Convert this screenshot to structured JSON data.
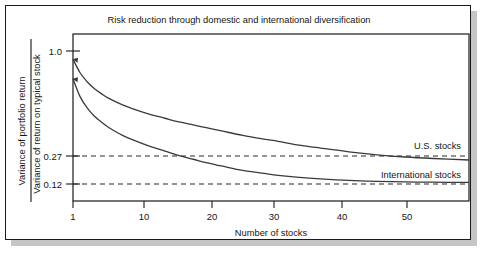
{
  "figure": {
    "title": "Risk reduction through domestic and international diversification"
  },
  "axes": {
    "x_title": "Number of stocks",
    "y_title_numerator": "Variance of portfolio return",
    "y_title_denominator": "Variance of return on typical stock",
    "x_ticks": [
      "1",
      "10",
      "20",
      "30",
      "40",
      "50"
    ],
    "y_ticks": [
      "1.0",
      "0.27",
      "0.12"
    ]
  },
  "series_labels": {
    "us": "U.S. stocks",
    "international": "International stocks"
  },
  "colors": {
    "curve": "#3a3a3a",
    "frame": "#1a1a1a",
    "text": "#151515",
    "background": "#ffffff",
    "shadow": "#969696"
  },
  "chart_data": {
    "type": "line",
    "title": "Risk reduction through domestic and international diversification",
    "xlabel": "Number of stocks",
    "ylabel": "Variance of portfolio return / Variance of return on typical stock",
    "xlim": [
      1,
      57
    ],
    "ylim": [
      0.0,
      1.12
    ],
    "grid": false,
    "legend": "inline-right",
    "x_ticks": [
      1,
      10,
      20,
      30,
      40,
      50
    ],
    "y_ticks": [
      1.0,
      0.27,
      0.12
    ],
    "annotations": [
      {
        "text": "U.S. stocks",
        "x": 47,
        "y": 0.42
      },
      {
        "text": "International stocks",
        "x": 45,
        "y": 0.22
      }
    ],
    "reference_lines": [
      {
        "label": "0.27",
        "value": 0.27,
        "style": "dashed"
      },
      {
        "label": "0.12",
        "value": 0.12,
        "style": "dashed"
      }
    ],
    "x": [
      1,
      2,
      3,
      4,
      5,
      6,
      8,
      10,
      12,
      14,
      16,
      18,
      20,
      22,
      25,
      28,
      30,
      33,
      36,
      40,
      44,
      48,
      52,
      57
    ],
    "series": [
      {
        "name": "U.S. stocks",
        "values": [
          0.95,
          0.86,
          0.8,
          0.755,
          0.72,
          0.69,
          0.645,
          0.61,
          0.58,
          0.555,
          0.53,
          0.51,
          0.49,
          0.47,
          0.44,
          0.415,
          0.4,
          0.375,
          0.355,
          0.33,
          0.31,
          0.295,
          0.285,
          0.275
        ]
      },
      {
        "name": "International stocks",
        "values": [
          0.82,
          0.7,
          0.625,
          0.57,
          0.53,
          0.495,
          0.44,
          0.4,
          0.365,
          0.335,
          0.305,
          0.28,
          0.255,
          0.235,
          0.205,
          0.185,
          0.172,
          0.158,
          0.148,
          0.138,
          0.132,
          0.128,
          0.126,
          0.125
        ]
      }
    ]
  }
}
